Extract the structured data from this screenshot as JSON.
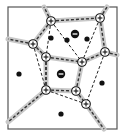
{
  "diagram": {
    "type": "voronoi-with-dual-connections",
    "frame": {
      "x": 8,
      "y": 7,
      "w": 109,
      "h": 122,
      "stroke": "#555555"
    },
    "colors": {
      "edge_band": "#c8c8c8",
      "edge_dash": "#333333",
      "connector": "#222222",
      "node_fill": "#ffffff",
      "node_stroke": "#111111",
      "dot": "#111111"
    },
    "plus_nodes": [
      {
        "id": "n1",
        "x": 51,
        "y": 21,
        "label": "+"
      },
      {
        "id": "n2",
        "x": 100,
        "y": 18,
        "label": "+"
      },
      {
        "id": "n3",
        "x": 33,
        "y": 44,
        "label": "+"
      },
      {
        "id": "n4",
        "x": 46,
        "y": 57,
        "label": "+"
      },
      {
        "id": "n5",
        "x": 82,
        "y": 62,
        "label": "+"
      },
      {
        "id": "n6",
        "x": 105,
        "y": 52,
        "label": "+"
      },
      {
        "id": "n7",
        "x": 46,
        "y": 90,
        "label": "+"
      },
      {
        "id": "n8",
        "x": 76,
        "y": 91,
        "label": "+"
      },
      {
        "id": "n9",
        "x": 86,
        "y": 104,
        "label": "+"
      }
    ],
    "minus_charges": [
      {
        "id": "m1",
        "x": 75,
        "y": 34,
        "label": "−"
      },
      {
        "id": "m2",
        "x": 61,
        "y": 74,
        "label": "−"
      }
    ],
    "dots": [
      {
        "x": 51,
        "y": 38
      },
      {
        "x": 67,
        "y": 40
      },
      {
        "x": 87,
        "y": 39
      },
      {
        "x": 19,
        "y": 74
      },
      {
        "x": 102,
        "y": 83
      },
      {
        "x": 61,
        "y": 114
      }
    ],
    "voronoi_edges": [
      [
        "n1",
        "n2"
      ],
      [
        "n1",
        "n3"
      ],
      [
        "n3",
        "n4"
      ],
      [
        "n4",
        "n5"
      ],
      [
        "n5",
        "n6"
      ],
      [
        "n2",
        "n6"
      ],
      [
        "n4",
        "n7"
      ],
      [
        "n7",
        "n8"
      ],
      [
        "n8",
        "n5"
      ],
      [
        "n8",
        "n9"
      ]
    ],
    "boundary_edges": [
      {
        "from": "n1",
        "to": [
          44,
          7
        ]
      },
      {
        "from": "n2",
        "to": [
          107,
          7
        ]
      },
      {
        "from": "n3",
        "to": [
          8,
          39
        ]
      },
      {
        "from": "n6",
        "to": [
          117,
          55
        ]
      },
      {
        "from": "n7",
        "to": [
          8,
          122
        ]
      },
      {
        "from": "n9",
        "to": [
          104,
          129
        ]
      }
    ],
    "connectors": [
      [
        "n1",
        "n5"
      ],
      [
        "n2",
        "n5"
      ],
      [
        "n3",
        "n7"
      ],
      [
        "n4",
        "n7"
      ],
      [
        "n6",
        "n9"
      ],
      [
        "n7",
        "n9"
      ],
      [
        "n1",
        "n4"
      ]
    ]
  }
}
